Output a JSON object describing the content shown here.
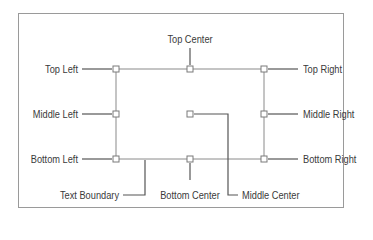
{
  "diagram": {
    "colors": {
      "frame": "#9a9a9a",
      "boundary": "#8a8a8a",
      "leader": "#555555",
      "handle_fill": "#ffffff",
      "handle_stroke": "#7a7a7a",
      "text": "#3a3a3a"
    },
    "labels": {
      "top_left": "Top Left",
      "top_center": "Top Center",
      "top_right": "Top Right",
      "middle_left": "Middle Left",
      "middle_center": "Middle Center",
      "middle_right": "Middle Right",
      "bottom_left": "Bottom Left",
      "bottom_center": "Bottom Center",
      "bottom_right": "Bottom Right",
      "text_boundary": "Text Boundary"
    },
    "handles": [
      {
        "id": "top-left",
        "x": 116,
        "y": 69
      },
      {
        "id": "top-center",
        "x": 190,
        "y": 69
      },
      {
        "id": "top-right",
        "x": 264,
        "y": 69
      },
      {
        "id": "middle-left",
        "x": 116,
        "y": 114
      },
      {
        "id": "middle-center",
        "x": 190,
        "y": 114
      },
      {
        "id": "middle-right",
        "x": 264,
        "y": 114
      },
      {
        "id": "bottom-left",
        "x": 116,
        "y": 159
      },
      {
        "id": "bottom-center",
        "x": 190,
        "y": 159
      },
      {
        "id": "bottom-right",
        "x": 264,
        "y": 159
      }
    ]
  }
}
